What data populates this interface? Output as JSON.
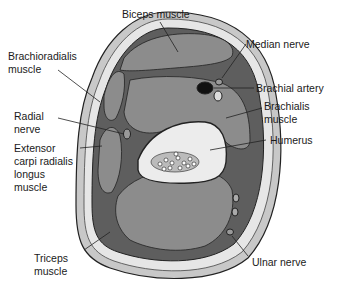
{
  "diagram": {
    "labels": {
      "biceps": "Biceps muscle",
      "brachioradialis": "Brachioradialis\nmuscle",
      "median_nerve": "Median nerve",
      "brachial_artery": "Brachial artery",
      "radial_nerve": "Radial\nnerve",
      "brachialis": "Brachialis\nmuscle",
      "humerus": "Humerus",
      "ecrl": "Extensor\ncarpi radialis\nlongus\nmuscle",
      "triceps": "Triceps\nmuscle",
      "ulnar_nerve": "Ulnar nerve"
    },
    "colors": {
      "muscle": "#8c8c8c",
      "skin": "#c8c8c8",
      "fat": "#e6e6e6",
      "fascia": "#5e5e5e",
      "bone": "#ececec",
      "artery": "#111111",
      "outline": "#222222"
    }
  }
}
